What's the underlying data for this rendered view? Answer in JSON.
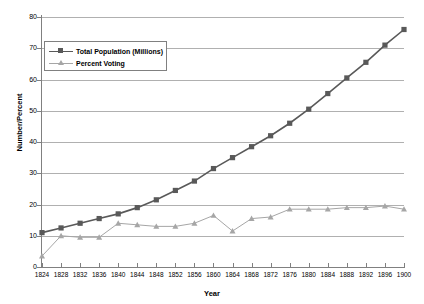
{
  "chart_data": {
    "type": "line",
    "title": "",
    "xlabel": "Year",
    "ylabel": "Number/Percent",
    "xlim": [
      1824,
      1900
    ],
    "ylim": [
      0,
      80
    ],
    "ytick_step": 10,
    "xtick_step": 4,
    "grid": true,
    "legend_position": "upper-left-inside",
    "categories": [
      1824,
      1828,
      1832,
      1836,
      1840,
      1844,
      1848,
      1852,
      1856,
      1860,
      1864,
      1868,
      1872,
      1876,
      1880,
      1884,
      1888,
      1892,
      1896,
      1900
    ],
    "xticks": [
      "1824",
      "1828",
      "1832",
      "1836",
      "1840",
      "1844",
      "1848",
      "1852",
      "1856",
      "1860",
      "1864",
      "1868",
      "1872",
      "1876",
      "1880",
      "1884",
      "1888",
      "1892",
      "1896",
      "1900"
    ],
    "yticks": [
      "0",
      "10",
      "20",
      "30",
      "40",
      "50",
      "60",
      "70",
      "80"
    ],
    "series": [
      {
        "name": "Total Population (Millions)",
        "marker": "square",
        "color": "#595959",
        "values": [
          11,
          12.5,
          14,
          15.5,
          17,
          19,
          21.5,
          24.5,
          27.5,
          31.5,
          35,
          38.5,
          42,
          46,
          50.5,
          55.5,
          60.5,
          65.5,
          71,
          76
        ]
      },
      {
        "name": "Percent Voting",
        "marker": "triangle",
        "color": "#a6a6a6",
        "values": [
          3.5,
          10,
          9.5,
          9.5,
          14,
          13.5,
          13,
          13,
          14,
          16.5,
          11.5,
          15.5,
          16,
          18.5,
          18.5,
          18.5,
          19,
          19,
          19.5,
          18.5
        ]
      }
    ]
  },
  "legend": {
    "items": [
      {
        "label": "Total Population (Millions)"
      },
      {
        "label": "Percent Voting"
      }
    ]
  },
  "axes": {
    "x_title": "Year",
    "y_title": "Number/Percent"
  },
  "colors": {
    "population": "#595959",
    "percent_voting": "#a6a6a6",
    "gridline": "#b0b0b0",
    "axis": "#808080",
    "background": "#ffffff"
  }
}
